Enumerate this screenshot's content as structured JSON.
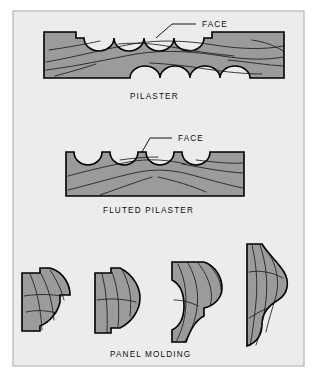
{
  "figure": {
    "panel": {
      "background_color": "#ececec",
      "border_color": "#b6b6b6",
      "outer_background_color": "#ffffff"
    },
    "wood": {
      "fill_color": "#9b9b9b",
      "outline_color": "#000000",
      "grain_color": "#1c1c1c"
    },
    "sections": [
      {
        "id": "pilaster",
        "caption": "PILASTER",
        "callout": "FACE",
        "description": "Scalloped pilaster stock with rabbeted ends"
      },
      {
        "id": "fluted-pilaster",
        "caption": "FLUTED PILASTER",
        "callout": "FACE",
        "description": "Flat stock with four flutes along the face",
        "flute_count": 4
      },
      {
        "id": "panel-molding",
        "caption": "PANEL  MOLDING",
        "description": "Four panel molding cross-section profiles",
        "profile_count": 4
      }
    ]
  }
}
